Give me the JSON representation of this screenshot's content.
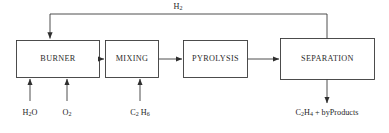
{
  "diagram": {
    "line_color": "#3a3a3a",
    "text_color": "#1f1f1f",
    "background": "#ffffff",
    "units": [
      {
        "id": "burner",
        "label": "BURNER"
      },
      {
        "id": "mixing",
        "label": "MIXING"
      },
      {
        "id": "pyrolysis",
        "label": "PYROLYSIS"
      },
      {
        "id": "separation",
        "label": "SEPARATION"
      }
    ],
    "streams": {
      "recycle": {
        "id": "h2-recycle",
        "label_main": "H",
        "label_sub": "2",
        "from": "separation",
        "to": "burner"
      },
      "water_feed": {
        "id": "water-feed",
        "label_a": "H",
        "label_a_sub": "2",
        "label_b": "O",
        "to": "burner"
      },
      "oxygen_feed": {
        "id": "oxygen-feed",
        "label_main": "O",
        "label_sub": "2",
        "to": "burner"
      },
      "ethane_feed": {
        "id": "ethane-feed",
        "label_c": "C",
        "label_c_sub": "2",
        "label_h": "H",
        "label_h_sub": "6",
        "to": "mixing"
      },
      "product_out": {
        "id": "product-outlet",
        "label_c": "C",
        "label_c_sub": "2",
        "label_h": "H",
        "label_h_sub": "4",
        "label_tail": "+ byProducts",
        "from": "separation"
      }
    },
    "connections": [
      {
        "id": "burner-to-mixing",
        "from": "burner",
        "to": "mixing"
      },
      {
        "id": "mixing-to-pyrolysis",
        "from": "mixing",
        "to": "pyrolysis"
      },
      {
        "id": "pyrolysis-to-separation",
        "from": "pyrolysis",
        "to": "separation"
      }
    ]
  }
}
